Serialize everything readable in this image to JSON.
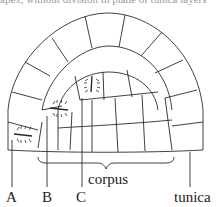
{
  "figure": {
    "cut_text": "apex, without division in plane of tunica layers",
    "labels": {
      "A": "A",
      "B": "B",
      "C": "C",
      "corpus": "corpus",
      "tunica": "tunica"
    },
    "colors": {
      "stroke": "#2a2a2a",
      "background": "#ffffff",
      "text": "#222222"
    }
  }
}
